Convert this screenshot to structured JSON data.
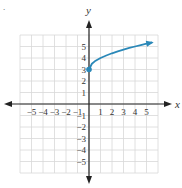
{
  "corner_mark": ".",
  "chart_data": {
    "type": "line",
    "title": "",
    "xlabel": "x",
    "ylabel": "y",
    "xlim": [
      -6,
      6
    ],
    "ylim": [
      -6,
      6
    ],
    "grid": true,
    "x_ticks": [
      -5,
      -4,
      -3,
      -2,
      -1,
      1,
      2,
      3,
      4,
      5
    ],
    "y_ticks": [
      -5,
      -4,
      -3,
      -2,
      -1,
      1,
      2,
      3,
      4,
      5
    ],
    "x_tick_labels": [
      "−5",
      "−4",
      "−3",
      "−2",
      "−1",
      "1",
      "2",
      "3",
      "4",
      "5"
    ],
    "y_tick_labels": [
      "−5",
      "−4",
      "−3",
      "−2",
      "−1",
      "1",
      "2",
      "3",
      "4",
      "5"
    ],
    "series": [
      {
        "name": "y = √x + 3",
        "start_point": [
          0,
          3
        ],
        "start_marker": "closed-dot",
        "end_marker": "arrow",
        "x": [
          0,
          0.25,
          0.5,
          1,
          1.5,
          2,
          2.5,
          3,
          3.5,
          4,
          4.5,
          5,
          5.5
        ],
        "values": [
          3,
          3.5,
          3.71,
          4,
          4.22,
          4.41,
          4.58,
          4.73,
          4.87,
          5,
          5.12,
          5.24,
          5.35
        ]
      }
    ],
    "colors": {
      "curve": "#2a88b8",
      "axis": "#222222",
      "grid": "#d8d8d8",
      "text": "#333333"
    }
  }
}
